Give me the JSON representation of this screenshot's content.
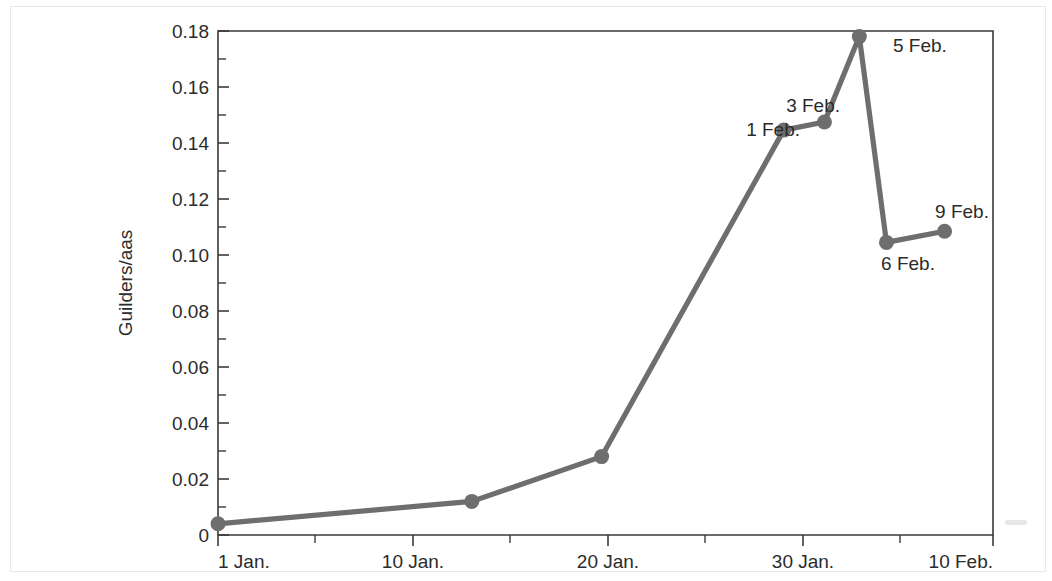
{
  "chart_data": {
    "type": "line",
    "title": "",
    "xlabel": "",
    "ylabel": "Guilders/aas",
    "xlim": [
      0,
      40
    ],
    "ylim": [
      0,
      0.18
    ],
    "grid": false,
    "legend": null,
    "series_color": "#6e6e6e",
    "x_tick_labels": [
      "1 Jan.",
      "10 Jan.",
      "20 Jan.",
      "30 Jan.",
      "10 Feb."
    ],
    "x_tick_days": [
      0,
      9,
      19,
      29,
      40
    ],
    "x_minor_tick_days": [
      4,
      14,
      24,
      34
    ],
    "y_tick_labels": [
      "0",
      "0.02",
      "0.04",
      "0.06",
      "0.08",
      "0.10",
      "0.12",
      "0.14",
      "0.16",
      "0.18"
    ],
    "y_tick_values": [
      0,
      0.02,
      0.04,
      0.06,
      0.08,
      0.1,
      0.12,
      0.14,
      0.16,
      0.18
    ],
    "y_minor_tick_values": [
      0.01,
      0.03,
      0.05,
      0.07,
      0.09,
      0.11,
      0.13,
      0.15,
      0.17
    ],
    "points": [
      {
        "day": 0.0,
        "date": "1 Jan.",
        "value": 0.004,
        "label": null
      },
      {
        "day": 13.1,
        "date": "14 Jan.",
        "value": 0.012,
        "label": null
      },
      {
        "day": 19.8,
        "date": "20 Jan.",
        "value": 0.028,
        "label": null
      },
      {
        "day": 29.2,
        "date": "1 Feb.",
        "value": 0.1446,
        "label": "1 Feb."
      },
      {
        "day": 31.3,
        "date": "3 Feb.",
        "value": 0.1475,
        "label": "3 Feb."
      },
      {
        "day": 33.1,
        "date": "5 Feb.",
        "value": 0.178,
        "label": "5 Feb."
      },
      {
        "day": 34.5,
        "date": "6 Feb.",
        "value": 0.1045,
        "label": "6 Feb."
      },
      {
        "day": 37.5,
        "date": "9 Feb.",
        "value": 0.1085,
        "label": "9 Feb."
      }
    ],
    "point_labels": [
      {
        "text": "1 Feb.",
        "anchor": "end",
        "px": 800,
        "py": 136
      },
      {
        "text": "3 Feb.",
        "anchor": "end",
        "px": 840,
        "py": 112
      },
      {
        "text": "5 Feb.",
        "anchor": "start",
        "px": 893,
        "py": 52
      },
      {
        "text": "6 Feb.",
        "anchor": "middle",
        "px": 908,
        "py": 270
      },
      {
        "text": "9 Feb.",
        "anchor": "middle",
        "px": 962,
        "py": 218
      }
    ]
  }
}
